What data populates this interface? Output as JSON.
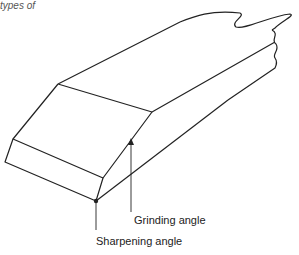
{
  "caption": "types of",
  "figure": {
    "labels": {
      "grinding": "Grinding angle",
      "sharpening": "Sharpening angle"
    },
    "stroke_color": "#222222"
  }
}
